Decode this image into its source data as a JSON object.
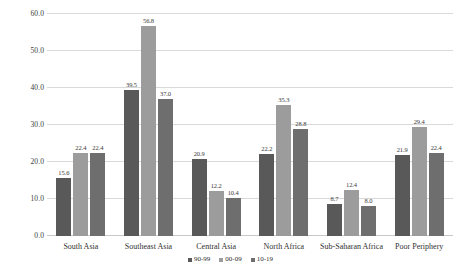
{
  "chart_data": {
    "type": "bar",
    "title": "",
    "subtitle": "",
    "xlabel": "",
    "ylabel": "",
    "ylim": [
      0,
      60
    ],
    "ytick_labels": [
      "0.0",
      "10.0",
      "20.0",
      "30.0",
      "40.0",
      "50.0",
      "60.0"
    ],
    "ytick_values": [
      0,
      10,
      20,
      30,
      40,
      50,
      60
    ],
    "grid": true,
    "legend_position": "bottom-center",
    "categories": [
      "South Asia",
      "Southeast Asia",
      "Central Asia",
      "North Africa",
      "Sub-Saharan Africa",
      "Poor Periphery"
    ],
    "series": [
      {
        "name": "90-99",
        "color": "#595959",
        "values": [
          15.6,
          39.5,
          20.9,
          22.2,
          8.7,
          21.9
        ],
        "labels": [
          "15.6",
          "39.5",
          "20.9",
          "22.2",
          "8.7",
          "21.9"
        ]
      },
      {
        "name": "00-09",
        "color": "#9c9c9c",
        "values": [
          22.4,
          56.8,
          12.2,
          35.3,
          12.4,
          29.4
        ],
        "labels": [
          "22.4",
          "56.8",
          "12.2",
          "35.3",
          "12.4",
          "29.4"
        ]
      },
      {
        "name": "10-19",
        "color": "#6e6e6e",
        "values": [
          22.4,
          37.0,
          10.4,
          28.8,
          8.0,
          22.4
        ],
        "labels": [
          "22.4",
          "37.0",
          "10.4",
          "28.8",
          "8.0",
          "22.4"
        ]
      }
    ]
  }
}
